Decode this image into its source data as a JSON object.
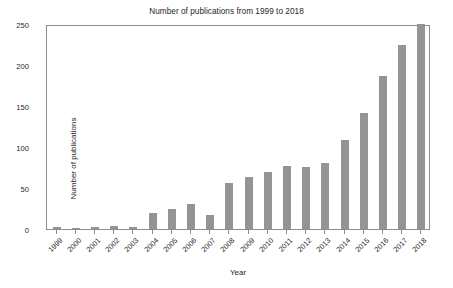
{
  "chart_data": {
    "type": "bar",
    "title": "Number of publications from 1999 to 2018",
    "xlabel": "Year",
    "ylabel": "Number of publications",
    "categories": [
      "1999",
      "2000",
      "2001",
      "2002",
      "2003",
      "2004",
      "2005",
      "2006",
      "2007",
      "2008",
      "2009",
      "2010",
      "2011",
      "2012",
      "2013",
      "2014",
      "2015",
      "2016",
      "2017",
      "2018"
    ],
    "values": [
      2,
      1,
      2,
      4,
      2,
      19,
      24,
      31,
      17,
      56,
      63,
      70,
      77,
      76,
      81,
      109,
      142,
      186,
      225,
      250
    ],
    "ylim": [
      0,
      250
    ],
    "yticks": [
      0,
      50,
      100,
      150,
      200,
      250
    ],
    "ytick_labels": [
      "0",
      "50",
      "100",
      "150",
      "200",
      "250"
    ],
    "grid": false,
    "legend": null,
    "bar_color": "#949494",
    "axis_color": "#8d8d8d",
    "background_color": "#ffffff"
  }
}
